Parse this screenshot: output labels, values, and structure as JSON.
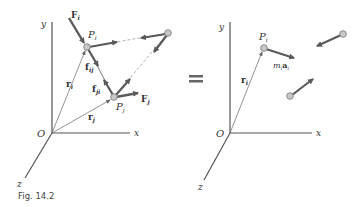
{
  "figure": {
    "caption": "Fig. 14.2",
    "equals_sign": "="
  },
  "left_diagram": {
    "axes": {
      "x_label": "x",
      "y_label": "y",
      "z_label": "z",
      "origin_label": "O"
    },
    "particles": [
      {
        "id": "Pi",
        "label": "P",
        "subscript": "i"
      },
      {
        "id": "Pj",
        "label": "P",
        "subscript": "j"
      },
      {
        "id": "P3",
        "label": ""
      }
    ],
    "forces": {
      "Fi": {
        "label": "F",
        "subscript": "i"
      },
      "Fj": {
        "label": "F",
        "subscript": "j"
      },
      "fij": {
        "label": "f",
        "subscript": "ij"
      },
      "fji": {
        "label": "f",
        "subscript": "ji"
      }
    },
    "position_vectors": {
      "ri": {
        "label": "r",
        "subscript": "i"
      },
      "rj": {
        "label": "r",
        "subscript": "j"
      }
    }
  },
  "right_diagram": {
    "axes": {
      "x_label": "x",
      "y_label": "y",
      "z_label": "z",
      "origin_label": "O"
    },
    "particles": [
      {
        "id": "Pi",
        "label": "P",
        "subscript": "i"
      }
    ],
    "inertia_vector": {
      "m": "m",
      "m_sub": "i",
      "a": "a",
      "a_sub": "i"
    },
    "position_vectors": {
      "ri": {
        "label": "r",
        "subscript": "i"
      }
    }
  },
  "colors": {
    "axis": "#555555",
    "force_arrow": "#5a5a5a",
    "particle_fill": "#c8c8c8",
    "particle_stroke": "#777777",
    "equals": "#666666"
  }
}
